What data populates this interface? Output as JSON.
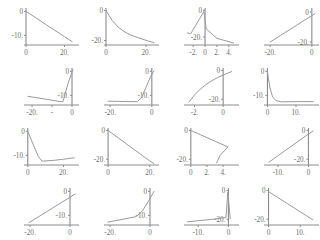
{
  "figure": {
    "type": "multi-panel-line-grid",
    "rows": 4,
    "cols": 4,
    "background": "#ffffff",
    "axis_color": "#8b8b8b",
    "curve_color": "#9a9a9a",
    "tick_label_color": "#6e6e6e"
  },
  "chart_data": [
    {
      "id": "panel-1",
      "type": "line",
      "title": "",
      "xlabel": "",
      "ylabel": "",
      "grid": false,
      "legend": "none",
      "xticks": [
        0,
        20
      ],
      "xticklabels": [
        "0",
        "20."
      ],
      "yticks": [
        0,
        -10
      ],
      "yticklabels": [
        "0",
        "-10."
      ],
      "xlim": [
        0,
        26
      ],
      "ylim": [
        -14,
        1
      ],
      "x": [
        0,
        5,
        10,
        15,
        20,
        24
      ],
      "y": [
        0,
        -2.6,
        -5.3,
        -7.9,
        -10.5,
        -12.6
      ]
    },
    {
      "id": "panel-2",
      "type": "line",
      "title": "",
      "xlabel": "",
      "ylabel": "",
      "grid": false,
      "legend": "none",
      "xticks": [
        0,
        20
      ],
      "xticklabels": [
        "0",
        "20."
      ],
      "yticks": [
        0,
        -20
      ],
      "yticklabels": [
        "0",
        "-20."
      ],
      "xlim": [
        0,
        25
      ],
      "ylim": [
        -23,
        1
      ],
      "x": [
        0,
        3,
        6,
        9,
        12,
        15,
        18,
        21,
        24
      ],
      "y": [
        0,
        -6.5,
        -11.0,
        -14.0,
        -16.2,
        -17.6,
        -19.0,
        -20.3,
        -21.5
      ]
    },
    {
      "id": "panel-3",
      "type": "line",
      "title": "",
      "xlabel": "",
      "ylabel": "",
      "grid": false,
      "legend": "none",
      "xticks": [
        -2,
        0,
        2,
        4
      ],
      "xticklabels": [
        "-2.",
        "0",
        "2.",
        "4."
      ],
      "yticks": [
        0,
        -20
      ],
      "yticklabels": [
        "0",
        "-20."
      ],
      "xlim": [
        -3.2,
        5.2
      ],
      "ylim": [
        -26,
        1
      ],
      "x": [
        -3.0,
        -2.4,
        -0.2,
        0.2,
        2.0,
        4.8
      ],
      "y": [
        -17.0,
        -17.5,
        -1.0,
        -14.0,
        -21.0,
        -24.5
      ]
    },
    {
      "id": "panel-4",
      "type": "line",
      "title": "",
      "xlabel": "",
      "ylabel": "",
      "grid": false,
      "legend": "none",
      "xticks": [
        -20,
        0
      ],
      "xticklabels": [
        "-20.",
        "0"
      ],
      "yticks": [
        0,
        -20
      ],
      "yticklabels": [
        "0",
        "-20."
      ],
      "xlim": [
        -22,
        2
      ],
      "ylim": [
        -22,
        2
      ],
      "x": [
        -20,
        -15,
        -10,
        -5,
        0,
        1.5
      ],
      "y": [
        -20,
        -15.6,
        -11.2,
        -6.8,
        -2.4,
        -1.1
      ]
    },
    {
      "id": "panel-5",
      "type": "line",
      "title": "",
      "xlabel": "",
      "ylabel": "",
      "grid": false,
      "legend": "none",
      "xticks": [
        -20,
        -10,
        0
      ],
      "xticklabels": [
        "-20.",
        "-",
        "0"
      ],
      "yticks": [
        0,
        -10
      ],
      "yticklabels": [
        "0",
        "-10."
      ],
      "xlim": [
        -23,
        2
      ],
      "ylim": [
        -14,
        1
      ],
      "x": [
        -22,
        -16,
        -10,
        -6,
        -4.5,
        -2.0,
        0.5
      ],
      "y": [
        -10.4,
        -11.2,
        -12.0,
        -12.6,
        -12.6,
        -5.0,
        0.8
      ]
    },
    {
      "id": "panel-6",
      "type": "line",
      "title": "",
      "xlabel": "",
      "ylabel": "",
      "grid": false,
      "legend": "none",
      "xticks": [
        -20,
        0
      ],
      "xticklabels": [
        "-20.",
        "0"
      ],
      "yticks": [
        0,
        -10
      ],
      "yticklabels": [
        "0",
        "-10."
      ],
      "xlim": [
        -22,
        2
      ],
      "ylim": [
        -14,
        1
      ],
      "x": [
        -21,
        -16,
        -11,
        -7,
        -5,
        -3,
        -0.5,
        1.0
      ],
      "y": [
        -12.4,
        -12.5,
        -12.6,
        -12.6,
        -11.0,
        -7.0,
        -2.0,
        0.2
      ]
    },
    {
      "id": "panel-7",
      "type": "line",
      "title": "",
      "xlabel": "",
      "ylabel": "",
      "grid": false,
      "legend": "none",
      "xticks": [
        -2,
        0
      ],
      "xticklabels": [
        "-2.",
        "0"
      ],
      "yticks": [
        0,
        -20
      ],
      "yticklabels": [
        "0",
        "-20."
      ],
      "xlim": [
        -2.6,
        0.9
      ],
      "ylim": [
        -24,
        1
      ],
      "x": [
        -2.4,
        -2.0,
        -1.6,
        -1.2,
        -0.8,
        -0.4,
        0.0,
        0.6
      ],
      "y": [
        -22.0,
        -17.0,
        -13.0,
        -9.8,
        -7.2,
        -5.0,
        -3.2,
        -0.8
      ]
    },
    {
      "id": "panel-8",
      "type": "line",
      "title": "",
      "xlabel": "",
      "ylabel": "",
      "grid": false,
      "legend": "none",
      "xticks": [
        0,
        10
      ],
      "xticklabels": [
        "0",
        "10."
      ],
      "yticks": [
        0,
        -10
      ],
      "yticklabels": [
        "0",
        "-10."
      ],
      "xlim": [
        -0.5,
        17
      ],
      "ylim": [
        -14,
        1
      ],
      "x": [
        0,
        0.8,
        1.8,
        3.0,
        5.0,
        8.0,
        12.0,
        16.0
      ],
      "y": [
        0,
        -6.5,
        -10.6,
        -12.2,
        -12.7,
        -12.6,
        -12.6,
        -12.6
      ]
    },
    {
      "id": "panel-9",
      "type": "line",
      "title": "",
      "xlabel": "",
      "ylabel": "",
      "grid": false,
      "legend": "none",
      "xticks": [
        0,
        20
      ],
      "xticklabels": [
        "0",
        "20."
      ],
      "yticks": [
        0,
        -10
      ],
      "yticklabels": [
        "0",
        "-10."
      ],
      "xlim": [
        -1,
        27
      ],
      "ylim": [
        -14,
        1
      ],
      "x": [
        0,
        2,
        4,
        6,
        8,
        14,
        20,
        26
      ],
      "y": [
        0,
        -3.6,
        -7.2,
        -10.6,
        -12.4,
        -12.1,
        -11.6,
        -11.0
      ]
    },
    {
      "id": "panel-10",
      "type": "line",
      "title": "",
      "xlabel": "",
      "ylabel": "",
      "grid": false,
      "legend": "none",
      "xticks": [
        0,
        20
      ],
      "xticklabels": [
        "0",
        "20."
      ],
      "yticks": [
        0,
        -20
      ],
      "yticklabels": [
        "0",
        "-20."
      ],
      "xlim": [
        -1,
        23
      ],
      "ylim": [
        -24,
        1
      ],
      "x": [
        0,
        5,
        10,
        15,
        20,
        22
      ],
      "y": [
        0,
        -5.3,
        -10.6,
        -15.9,
        -21.2,
        -23.0
      ]
    },
    {
      "id": "panel-11",
      "type": "line",
      "title": "",
      "xlabel": "",
      "ylabel": "",
      "grid": false,
      "legend": "none",
      "xticks": [
        0,
        2,
        4
      ],
      "xticklabels": [
        "0",
        "2.",
        "4."
      ],
      "yticks": [
        0,
        -20
      ],
      "yticklabels": [
        "0",
        "-20."
      ],
      "xlim": [
        -0.6,
        5.6
      ],
      "ylim": [
        -24,
        1
      ],
      "x": [
        0,
        1.2,
        2.4,
        3.6,
        4.6,
        3.6,
        3.2
      ],
      "y": [
        0,
        -3.0,
        -6.0,
        -9.0,
        -11.4,
        -17.5,
        -22.5
      ]
    },
    {
      "id": "panel-12",
      "type": "line",
      "title": "",
      "xlabel": "",
      "ylabel": "",
      "grid": false,
      "legend": "none",
      "xticks": [
        -10,
        0
      ],
      "xticklabels": [
        "-10.",
        "0"
      ],
      "yticks": [
        0,
        -20
      ],
      "yticklabels": [
        "0",
        "-20."
      ],
      "xlim": [
        -14,
        2.5
      ],
      "ylim": [
        -24,
        1
      ],
      "x": [
        -13.0,
        -10.0,
        -7.0,
        -4.0,
        -1.0,
        1.5
      ],
      "y": [
        -22.0,
        -17.5,
        -13.0,
        -8.5,
        -4.0,
        -0.4
      ]
    },
    {
      "id": "panel-13",
      "type": "line",
      "title": "",
      "xlabel": "",
      "ylabel": "",
      "grid": false,
      "legend": "none",
      "xticks": [
        -20,
        0
      ],
      "xticklabels": [
        "-20.",
        "0"
      ],
      "yticks": [
        0,
        -10
      ],
      "yticklabels": [
        "0",
        "-10."
      ],
      "xlim": [
        -22,
        3
      ],
      "ylim": [
        -14,
        1
      ],
      "x": [
        -20.5,
        -15,
        -10,
        -5,
        0,
        2.5
      ],
      "y": [
        -13.0,
        -10.2,
        -7.6,
        -5.0,
        -2.4,
        -1.1
      ]
    },
    {
      "id": "panel-14",
      "type": "line",
      "title": "",
      "xlabel": "",
      "ylabel": "",
      "grid": false,
      "legend": "none",
      "xticks": [
        -20,
        0
      ],
      "xticklabels": [
        "-20.",
        "0"
      ],
      "yticks": [
        0,
        -10
      ],
      "yticklabels": [
        "0",
        "-10."
      ],
      "xlim": [
        -22,
        3
      ],
      "ylim": [
        -14,
        1
      ],
      "x": [
        -21,
        -16,
        -11,
        -7,
        -4,
        -1,
        2.0
      ],
      "y": [
        -12.8,
        -12.0,
        -11.2,
        -10.5,
        -8.4,
        -4.4,
        0.0
      ]
    },
    {
      "id": "panel-15",
      "type": "line",
      "title": "",
      "xlabel": "",
      "ylabel": "",
      "grid": false,
      "legend": "none",
      "xticks": [
        -10,
        0
      ],
      "xticklabels": [
        "-10.",
        "0"
      ],
      "yticks": [
        0,
        -20
      ],
      "yticklabels": [
        "0",
        "-20."
      ],
      "xlim": [
        -14,
        2.5
      ],
      "ylim": [
        -24,
        1
      ],
      "x": [
        -13.5,
        -10,
        -6,
        -3,
        -0.8,
        -0.2,
        0.6
      ],
      "y": [
        -21.8,
        -21.0,
        -20.2,
        -19.4,
        -18.8,
        -1.0,
        -19.5
      ]
    },
    {
      "id": "panel-16",
      "type": "line",
      "title": "",
      "xlabel": "",
      "ylabel": "",
      "grid": false,
      "legend": "none",
      "xticks": [
        0,
        10
      ],
      "xticklabels": [
        "0",
        "10."
      ],
      "yticks": [
        0,
        -20
      ],
      "yticklabels": [
        "0",
        "-20."
      ],
      "xlim": [
        -0.8,
        15
      ],
      "ylim": [
        -24,
        1
      ],
      "x": [
        0,
        3,
        6,
        9,
        12,
        14
      ],
      "y": [
        -0.8,
        -5.0,
        -9.2,
        -13.4,
        -17.6,
        -20.4
      ]
    }
  ]
}
